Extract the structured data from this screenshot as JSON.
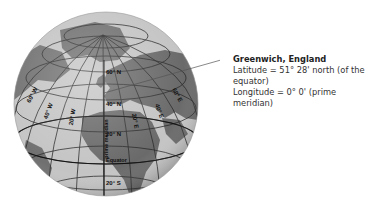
{
  "callout": {
    "title": "Greenwich, England",
    "latitude": "Latitude = 51° 28' north (of the equator)",
    "longitude": "Longitude = 0° 0' (prime meridian)"
  },
  "globe": {
    "labels": {
      "lat_60n": "60° N",
      "lat_40n": "40° N",
      "lat_20n": "20° N",
      "equator": "Equator",
      "lat_20s": "20° S",
      "lon_60w": "60° W",
      "lon_40w": "40° W",
      "lon_20w": "20° W",
      "lon_20e": "20° E",
      "lon_40e": "40° E",
      "lon_60e": "60° E",
      "prime_meridian": "prime meridian"
    },
    "colors": {
      "ocean": "#c4c4c4",
      "land": "#6e6e6e",
      "grid": "#2a2a2a"
    }
  }
}
